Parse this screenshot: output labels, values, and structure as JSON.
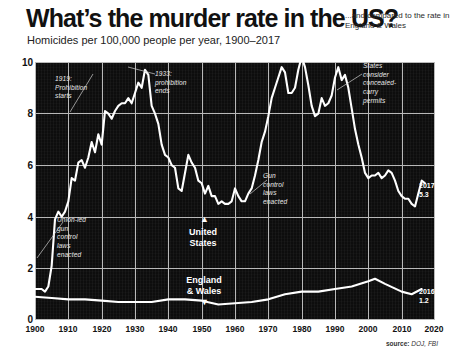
{
  "header": {
    "title": "What’s the murder rate in the US?",
    "kicker": "...and compared to the rate in England & Wales",
    "subtitle": "Homicides per 100,000 people per year, 1900–2017"
  },
  "source": {
    "label": "source:",
    "value": "DOJ, FBI"
  },
  "colors": {
    "plot_background": "#0d0d0d",
    "gridline": "#b9b9b9",
    "line": "#ffffff",
    "text_dark": "#111111",
    "annotation": "#e8e8e8"
  },
  "annotations": [
    {
      "id": "prohibition-starts",
      "text": "1919:\nProhibition\nstarts",
      "x": 55,
      "y": 75
    },
    {
      "id": "prohibition-ends",
      "text": "1933:\nprohibition\nends",
      "x": 155,
      "y": 70
    },
    {
      "id": "union-gun-laws",
      "text": "Union-led\ngun\ncontrol\nlaws\nenacted",
      "x": 57,
      "y": 216
    },
    {
      "id": "gun-control-laws",
      "text": "Gun\ncontrol\nlaws\nenacted",
      "x": 263,
      "y": 172
    },
    {
      "id": "concealed-carry",
      "text": "States\nconsider\nconcealed-\ncarry\npermits",
      "x": 363,
      "y": 62
    }
  ],
  "series_labels": [
    {
      "id": "united-states",
      "line1": "United",
      "line2": "States",
      "x": 193,
      "y": 224
    },
    {
      "id": "england-wales",
      "line1": "England",
      "line2": "& Wales",
      "x": 188,
      "y": 272
    }
  ],
  "end_labels": [
    {
      "id": "us-2017",
      "year": "2017",
      "value": "5.3",
      "x": 420,
      "y": 184
    },
    {
      "id": "ew-2016",
      "year": "2016",
      "value": "1.2",
      "x": 420,
      "y": 290
    }
  ],
  "chart_data": {
    "type": "line",
    "title": "What’s the murder rate in the US?",
    "subtitle": "Homicides per 100,000 people per year, 1900–2017",
    "xlabel": "",
    "ylabel": "Homicides per 100,000 people per year",
    "xlim": [
      1900,
      2020
    ],
    "ylim": [
      0,
      10
    ],
    "xticks": [
      1900,
      1910,
      1920,
      1930,
      1940,
      1950,
      1960,
      1970,
      1980,
      1990,
      2000,
      2010,
      2020
    ],
    "yticks": [
      0,
      2,
      4,
      6,
      8,
      10
    ],
    "grid": true,
    "legend": "inline-labels",
    "source": "DOJ, FBI",
    "series": [
      {
        "name": "United States",
        "x": [
          1900,
          1901,
          1902,
          1903,
          1904,
          1905,
          1906,
          1907,
          1908,
          1909,
          1910,
          1911,
          1912,
          1913,
          1914,
          1915,
          1916,
          1917,
          1918,
          1919,
          1920,
          1921,
          1922,
          1923,
          1924,
          1925,
          1926,
          1927,
          1928,
          1929,
          1930,
          1931,
          1932,
          1933,
          1934,
          1935,
          1936,
          1937,
          1938,
          1939,
          1940,
          1941,
          1942,
          1943,
          1944,
          1945,
          1946,
          1947,
          1948,
          1949,
          1950,
          1951,
          1952,
          1953,
          1954,
          1955,
          1956,
          1957,
          1958,
          1959,
          1960,
          1961,
          1962,
          1963,
          1964,
          1965,
          1966,
          1967,
          1968,
          1969,
          1970,
          1971,
          1972,
          1973,
          1974,
          1975,
          1976,
          1977,
          1978,
          1979,
          1980,
          1981,
          1982,
          1983,
          1984,
          1985,
          1986,
          1987,
          1988,
          1989,
          1990,
          1991,
          1992,
          1993,
          1994,
          1995,
          1996,
          1997,
          1998,
          1999,
          2000,
          2001,
          2002,
          2003,
          2004,
          2005,
          2006,
          2007,
          2008,
          2009,
          2010,
          2011,
          2012,
          2013,
          2014,
          2015,
          2016,
          2017
        ],
        "values": [
          1.2,
          1.2,
          1.2,
          1.1,
          1.3,
          2.1,
          3.9,
          4.2,
          4.0,
          4.2,
          4.6,
          5.5,
          5.4,
          6.1,
          6.2,
          5.9,
          6.3,
          6.9,
          6.5,
          7.2,
          6.8,
          8.1,
          8.0,
          7.8,
          8.1,
          8.3,
          8.4,
          8.4,
          8.6,
          8.4,
          8.8,
          9.2,
          9.0,
          9.7,
          9.5,
          8.3,
          8.0,
          7.6,
          6.8,
          6.4,
          6.3,
          6.0,
          5.9,
          5.1,
          5.0,
          5.7,
          6.4,
          6.1,
          5.9,
          5.4,
          5.3,
          4.9,
          5.2,
          4.8,
          4.8,
          4.5,
          4.6,
          4.5,
          4.5,
          4.6,
          5.1,
          4.8,
          4.6,
          4.6,
          4.9,
          5.1,
          5.6,
          6.2,
          6.9,
          7.3,
          7.9,
          8.6,
          9.0,
          9.4,
          9.8,
          9.6,
          8.8,
          8.8,
          9.0,
          9.7,
          10.2,
          9.8,
          9.1,
          8.3,
          7.9,
          8.0,
          8.6,
          8.3,
          8.4,
          8.7,
          9.4,
          9.8,
          9.3,
          9.5,
          9.0,
          8.2,
          7.4,
          6.8,
          6.3,
          5.7,
          5.5,
          5.6,
          5.6,
          5.7,
          5.5,
          5.6,
          5.8,
          5.7,
          5.4,
          5.0,
          4.8,
          4.7,
          4.7,
          4.5,
          4.4,
          4.9,
          5.4,
          5.3
        ]
      },
      {
        "name": "England & Wales",
        "x": [
          1900,
          1905,
          1910,
          1915,
          1920,
          1925,
          1930,
          1935,
          1940,
          1945,
          1950,
          1955,
          1960,
          1965,
          1970,
          1975,
          1980,
          1985,
          1990,
          1995,
          2000,
          2002,
          2005,
          2010,
          2013,
          2016
        ],
        "values": [
          0.9,
          0.85,
          0.8,
          0.8,
          0.75,
          0.7,
          0.7,
          0.7,
          0.8,
          0.8,
          0.75,
          0.6,
          0.65,
          0.7,
          0.8,
          1.0,
          1.1,
          1.1,
          1.2,
          1.3,
          1.5,
          1.6,
          1.4,
          1.1,
          1.0,
          1.2
        ]
      }
    ]
  }
}
